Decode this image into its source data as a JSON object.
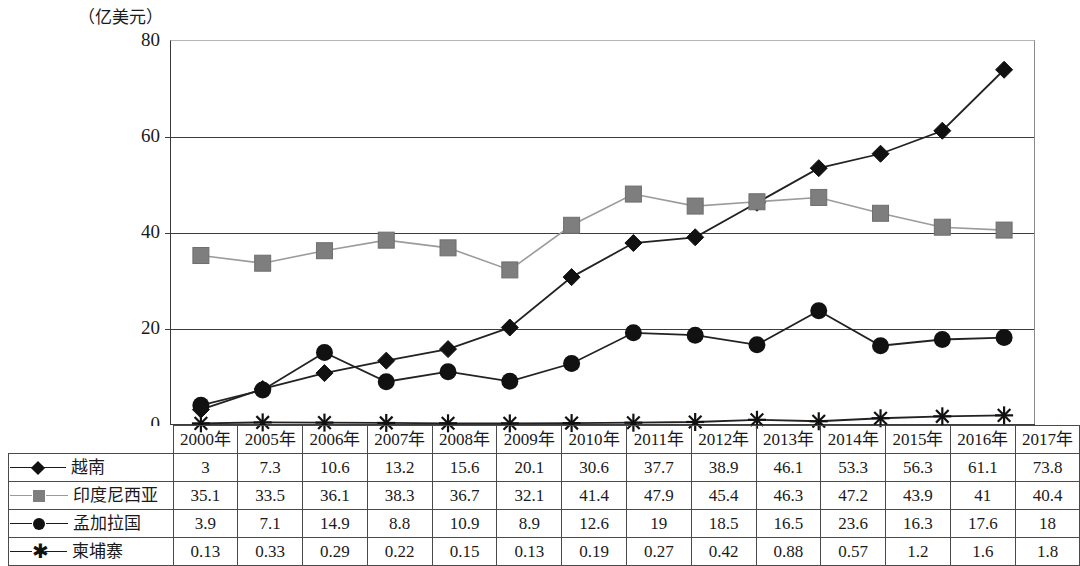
{
  "chart_data": {
    "type": "line",
    "title": "",
    "unit_label": "（亿美元）",
    "xlabel": "",
    "ylabel": "",
    "ylim": [
      0,
      80
    ],
    "yticks": [
      0,
      20,
      40,
      60,
      80
    ],
    "grid": true,
    "legend_position": "table-left-column",
    "categories": [
      "2000年",
      "2005年",
      "2006年",
      "2007年",
      "2008年",
      "2009年",
      "2010年",
      "2011年",
      "2012年",
      "2013年",
      "2014年",
      "2015年",
      "2016年",
      "2017年"
    ],
    "series": [
      {
        "name": "越南",
        "marker": "diamond",
        "color": "#111111",
        "values": [
          3,
          7.3,
          10.6,
          13.2,
          15.6,
          20.1,
          30.6,
          37.7,
          38.9,
          46.1,
          53.3,
          56.3,
          61.1,
          73.8
        ],
        "labels": [
          "3",
          "7.3",
          "10.6",
          "13.2",
          "15.6",
          "20.1",
          "30.6",
          "37.7",
          "38.9",
          "46.1",
          "53.3",
          "56.3",
          "61.1",
          "73.8"
        ]
      },
      {
        "name": "印度尼西亚",
        "marker": "square",
        "color": "#7e7e7e",
        "values": [
          35.1,
          33.5,
          36.1,
          38.3,
          36.7,
          32.1,
          41.4,
          47.9,
          45.4,
          46.3,
          47.2,
          43.9,
          41,
          40.4
        ],
        "labels": [
          "35.1",
          "33.5",
          "36.1",
          "38.3",
          "36.7",
          "32.1",
          "41.4",
          "47.9",
          "45.4",
          "46.3",
          "47.2",
          "43.9",
          "41",
          "40.4"
        ]
      },
      {
        "name": "孟加拉国",
        "marker": "circle",
        "color": "#111111",
        "values": [
          3.9,
          7.1,
          14.9,
          8.8,
          10.9,
          8.9,
          12.6,
          19,
          18.5,
          16.5,
          23.6,
          16.3,
          17.6,
          18
        ],
        "labels": [
          "3.9",
          "7.1",
          "14.9",
          "8.8",
          "10.9",
          "8.9",
          "12.6",
          "19",
          "18.5",
          "16.5",
          "23.6",
          "16.3",
          "17.6",
          "18"
        ]
      },
      {
        "name": "柬埔寨",
        "marker": "asterisk",
        "color": "#111111",
        "values": [
          0.13,
          0.33,
          0.29,
          0.22,
          0.15,
          0.13,
          0.19,
          0.27,
          0.42,
          0.88,
          0.57,
          1.2,
          1.6,
          1.8
        ],
        "labels": [
          "0.13",
          "0.33",
          "0.29",
          "0.22",
          "0.15",
          "0.13",
          "0.19",
          "0.27",
          "0.42",
          "0.88",
          "0.57",
          "1.2",
          "1.6",
          "1.8"
        ]
      }
    ]
  },
  "table": {
    "corner_label": "",
    "legend_glyphs": [
      "diamond",
      "square",
      "circle",
      "asterisk"
    ]
  }
}
